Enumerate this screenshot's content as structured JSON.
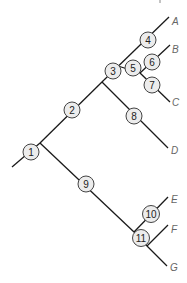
{
  "diagram": {
    "type": "phylogenetic-tree",
    "tips": [
      {
        "id": "A",
        "label": "A",
        "x": 176,
        "y": 21
      },
      {
        "id": "B",
        "label": "B",
        "x": 176,
        "y": 49
      },
      {
        "id": "C",
        "label": "C",
        "x": 176,
        "y": 102
      },
      {
        "id": "D",
        "label": "D",
        "x": 176,
        "y": 150
      },
      {
        "id": "E",
        "label": "E",
        "x": 176,
        "y": 199
      },
      {
        "id": "F",
        "label": "F",
        "x": 176,
        "y": 229
      },
      {
        "id": "G",
        "label": "G",
        "x": 174,
        "y": 267
      }
    ],
    "nodes": [
      {
        "id": "1",
        "label": "1",
        "cx": 31,
        "cy": 152
      },
      {
        "id": "2",
        "label": "2",
        "cx": 72,
        "cy": 110
      },
      {
        "id": "3",
        "label": "3",
        "cx": 113,
        "cy": 71
      },
      {
        "id": "4",
        "label": "4",
        "cx": 148,
        "cy": 40
      },
      {
        "id": "5",
        "label": "5",
        "cx": 133,
        "cy": 68
      },
      {
        "id": "6",
        "label": "6",
        "cx": 152,
        "cy": 62
      },
      {
        "id": "7",
        "label": "7",
        "cx": 152,
        "cy": 85
      },
      {
        "id": "8",
        "label": "8",
        "cx": 134,
        "cy": 116
      },
      {
        "id": "9",
        "label": "9",
        "cx": 86,
        "cy": 184
      },
      {
        "id": "10",
        "label": "10",
        "cx": 151,
        "cy": 214
      },
      {
        "id": "11",
        "label": "11",
        "cx": 141,
        "cy": 238
      }
    ],
    "colors": {
      "line": "#1a1a1a",
      "node_fill": "#ececec",
      "node_stroke": "#444444",
      "tip_label": "#666666"
    }
  }
}
